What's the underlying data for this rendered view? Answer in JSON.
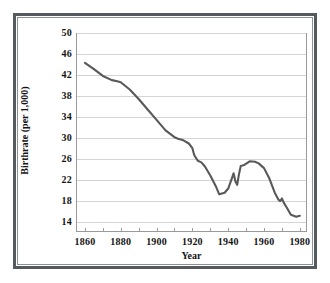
{
  "chart_data": {
    "type": "line",
    "title": "",
    "xlabel": "Year",
    "ylabel": "Birthrate (per 1,000)",
    "xlim": [
      1855,
      1984
    ],
    "ylim": [
      12,
      50
    ],
    "grid": true,
    "legend": "none",
    "line_color": "#595959",
    "grid_color": "#d4d4d4",
    "axis_color": "#9a9a9a",
    "y_ticks": [
      14,
      18,
      22,
      26,
      30,
      34,
      38,
      42,
      46,
      50
    ],
    "x_ticks": [
      1860,
      1880,
      1900,
      1920,
      1940,
      1960,
      1980
    ],
    "x_minor_ticks": [
      1860,
      1870,
      1880,
      1890,
      1900,
      1910,
      1920,
      1930,
      1940,
      1950,
      1960,
      1970,
      1980
    ],
    "series": [
      {
        "name": "Birthrate",
        "x": [
          1860,
          1865,
          1870,
          1875,
          1878,
          1880,
          1885,
          1890,
          1895,
          1900,
          1905,
          1910,
          1912,
          1915,
          1918,
          1920,
          1921,
          1923,
          1925,
          1927,
          1930,
          1933,
          1935,
          1936,
          1938,
          1940,
          1942,
          1943,
          1944,
          1945,
          1946,
          1947,
          1949,
          1952,
          1955,
          1957,
          1960,
          1963,
          1966,
          1968,
          1969,
          1970,
          1971,
          1973,
          1975,
          1978,
          1980
        ],
        "y": [
          44.3,
          43.1,
          41.8,
          41.0,
          40.8,
          40.6,
          39.2,
          37.4,
          35.4,
          33.4,
          31.4,
          30.1,
          29.8,
          29.5,
          28.9,
          28.0,
          26.7,
          25.6,
          25.3,
          24.5,
          22.8,
          20.8,
          19.2,
          19.3,
          19.5,
          20.3,
          22.2,
          23.2,
          21.7,
          21.0,
          23.0,
          24.6,
          24.8,
          25.5,
          25.4,
          25.1,
          24.2,
          22.2,
          19.5,
          18.2,
          17.9,
          18.4,
          17.6,
          16.5,
          15.3,
          14.9,
          15.1
        ]
      }
    ]
  },
  "axes": {
    "x_tick_labels": [
      "1860",
      "1880",
      "1900",
      "1920",
      "1940",
      "1960",
      "1980"
    ],
    "y_tick_labels": [
      "14",
      "18",
      "22",
      "26",
      "30",
      "34",
      "38",
      "42",
      "46",
      "50"
    ],
    "x_axis_title": "Year",
    "y_axis_title": "Birthrate (per 1,000)"
  }
}
